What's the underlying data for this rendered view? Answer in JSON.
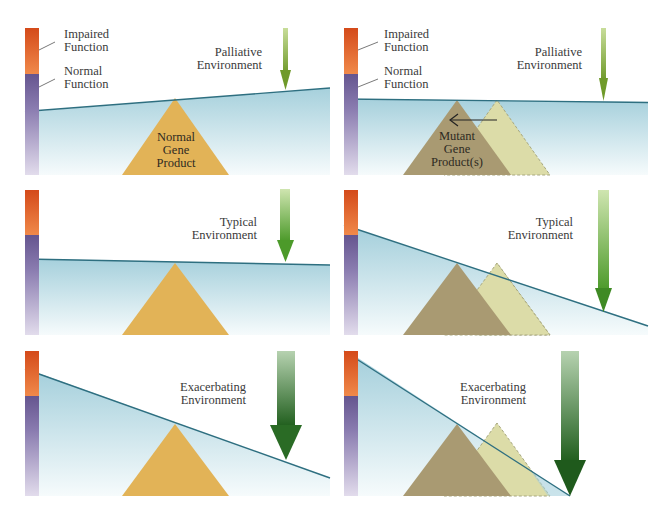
{
  "figure": {
    "legend": {
      "impaired_line1": "Impaired",
      "impaired_line2": "Function",
      "normal_line1": "Normal",
      "normal_line2": "Function"
    },
    "colors": {
      "impaired_top": "#d9541e",
      "impaired_bottom": "#f08a4a",
      "normal_top": "#6a5a92",
      "normal_bottom": "#ddd6ea",
      "water_top": "#a8d2dc",
      "water_bottom": "#ffffff",
      "surface_line": "#2e6f80",
      "normal_product": "#e2b357",
      "mutant_product": "#a99a72",
      "shifted_product": "#dcdca8",
      "arrow_light": "#8cbf3c",
      "arrow_dark": "#2f6e24"
    },
    "panels": [
      {
        "id": "palliative-normal",
        "environment_line1": "Palliative",
        "environment_line2": "Environment",
        "product_line1": "Normal",
        "product_line2": "Gene",
        "product_line3": "Product"
      },
      {
        "id": "palliative-mutant",
        "environment_line1": "Palliative",
        "environment_line2": "Environment",
        "product_line1": "Mutant",
        "product_line2": "Gene",
        "product_line3": "Product(s)"
      },
      {
        "id": "typical-normal",
        "environment_line1": "Typical",
        "environment_line2": "Environment"
      },
      {
        "id": "typical-mutant",
        "environment_line1": "Typical",
        "environment_line2": "Environment"
      },
      {
        "id": "exacerbating-normal",
        "environment_line1": "Exacerbating",
        "environment_line2": "Environment"
      },
      {
        "id": "exacerbating-mutant",
        "environment_line1": "Exacerbating",
        "environment_line2": "Environment"
      }
    ]
  }
}
